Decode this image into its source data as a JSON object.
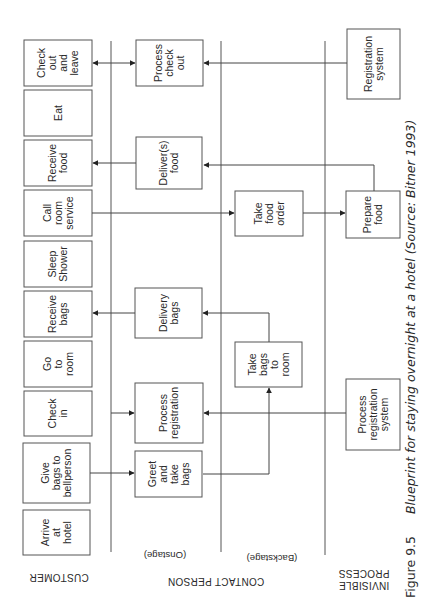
{
  "lanes": {
    "customer": "CUSTOMER",
    "contact_person": "CONTACT PERSON",
    "onstage": "(Onstage)",
    "backstage": "(Backstage)",
    "invisible_process": [
      "INVISIBLE",
      "PROCESS"
    ]
  },
  "customer_actions": [
    {
      "id": "check-out-and-leave",
      "lines": [
        "Check",
        "out",
        "and",
        "leave"
      ]
    },
    {
      "id": "eat",
      "lines": [
        "Eat"
      ]
    },
    {
      "id": "receive-food",
      "lines": [
        "Receive",
        "food"
      ]
    },
    {
      "id": "call-room-service",
      "lines": [
        "Call",
        "room",
        "service"
      ]
    },
    {
      "id": "sleep-shower",
      "lines": [
        "Sleep",
        "Shower"
      ]
    },
    {
      "id": "receive-bags",
      "lines": [
        "Receive",
        "bags"
      ]
    },
    {
      "id": "go-to-room",
      "lines": [
        "Go",
        "to",
        "room"
      ]
    },
    {
      "id": "check-in",
      "lines": [
        "Check",
        "in"
      ]
    },
    {
      "id": "give-bags-to-bellperson",
      "lines": [
        "Give",
        "bags to",
        "bellperson"
      ]
    },
    {
      "id": "arrive-at-hotel",
      "lines": [
        "Arrive",
        "at",
        "hotel"
      ]
    }
  ],
  "onstage_actions": [
    {
      "id": "process-check-out",
      "lines": [
        "Process",
        "check",
        "out"
      ]
    },
    {
      "id": "deliver-food",
      "lines": [
        "Deliver(s)",
        "food"
      ]
    },
    {
      "id": "delivery-bags",
      "lines": [
        "Delivery",
        "bags"
      ]
    },
    {
      "id": "process-registration",
      "lines": [
        "Process",
        "registration"
      ]
    },
    {
      "id": "greet-and-take-bags",
      "lines": [
        "Greet",
        "and",
        "take",
        "bags"
      ]
    }
  ],
  "backstage_actions": [
    {
      "id": "take-food-order",
      "lines": [
        "Take",
        "food",
        "order"
      ]
    },
    {
      "id": "take-bags-to-room",
      "lines": [
        "Take",
        "bags",
        "to",
        "room"
      ]
    }
  ],
  "invisible_actions": [
    {
      "id": "registration-system",
      "lines": [
        "Registration",
        "system"
      ]
    },
    {
      "id": "prepare-food",
      "lines": [
        "Prepare",
        "food"
      ]
    },
    {
      "id": "process-registration-system",
      "lines": [
        "Process",
        "registration",
        "system"
      ]
    }
  ],
  "caption": {
    "figure": "Figure 9.5",
    "title": "Blueprint for staying overnight at a hotel (Source: Bitner 1993)"
  }
}
